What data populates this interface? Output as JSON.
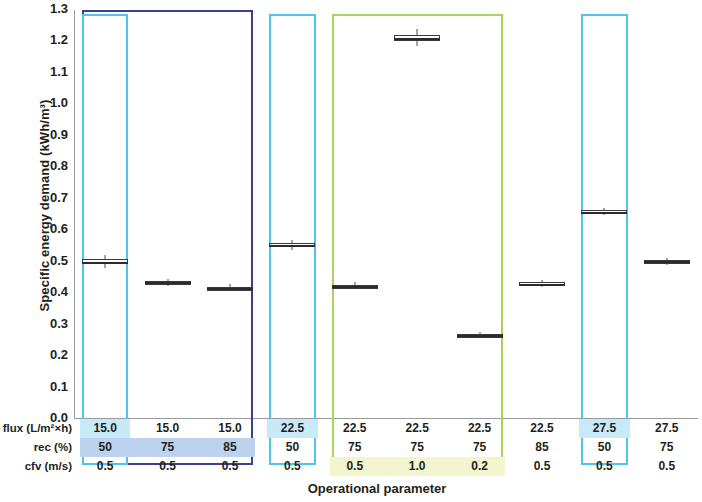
{
  "chart_data": {
    "type": "box",
    "title": "",
    "xlabel": "Operational parameter",
    "ylabel": "Specific energy demand (kWh/m³)",
    "ylim": [
      0.0,
      1.3
    ],
    "ytick_labels": [
      "1.3",
      "1.2",
      "1.1",
      "1.0",
      "0.9",
      "0.8",
      "0.7",
      "0.6",
      "0.5",
      "0.4",
      "0.3",
      "0.2",
      "0.1",
      "0.0"
    ],
    "ytick_values": [
      1.3,
      1.2,
      1.1,
      1.0,
      0.9,
      0.8,
      0.7,
      0.6,
      0.5,
      0.4,
      0.3,
      0.2,
      0.1,
      0.0
    ],
    "grid": false,
    "legend": "none",
    "parameter_rows": [
      {
        "label": "flux (L/m²×h)",
        "key": "flux"
      },
      {
        "label": "rec (%)",
        "key": "rec"
      },
      {
        "label": "cfv (m/s)",
        "key": "cfv"
      }
    ],
    "categories": [
      {
        "flux": "15.0",
        "rec": "50",
        "cfv": "0.5"
      },
      {
        "flux": "15.0",
        "rec": "75",
        "cfv": "0.5"
      },
      {
        "flux": "15.0",
        "rec": "85",
        "cfv": "0.5"
      },
      {
        "flux": "22.5",
        "rec": "50",
        "cfv": "0.5"
      },
      {
        "flux": "22.5",
        "rec": "75",
        "cfv": "0.5"
      },
      {
        "flux": "22.5",
        "rec": "75",
        "cfv": "1.0"
      },
      {
        "flux": "22.5",
        "rec": "75",
        "cfv": "0.2"
      },
      {
        "flux": "22.5",
        "rec": "85",
        "cfv": "0.5"
      },
      {
        "flux": "27.5",
        "rec": "50",
        "cfv": "0.5"
      },
      {
        "flux": "27.5",
        "rec": "75",
        "cfv": "0.5"
      }
    ],
    "boxes": [
      {
        "index": 0,
        "median": 0.5,
        "q1": 0.492,
        "q3": 0.51,
        "whisker_low": 0.48,
        "whisker_high": 0.522
      },
      {
        "index": 1,
        "median": 0.434,
        "q1": 0.43,
        "q3": 0.438,
        "whisker_low": 0.423,
        "whisker_high": 0.444
      },
      {
        "index": 2,
        "median": 0.417,
        "q1": 0.413,
        "q3": 0.421,
        "whisker_low": 0.406,
        "whisker_high": 0.428
      },
      {
        "index": 3,
        "median": 0.553,
        "q1": 0.547,
        "q3": 0.56,
        "whisker_low": 0.538,
        "whisker_high": 0.57
      },
      {
        "index": 4,
        "median": 0.423,
        "q1": 0.419,
        "q3": 0.427,
        "whisker_low": 0.412,
        "whisker_high": 0.434
      },
      {
        "index": 5,
        "median": 1.212,
        "q1": 1.203,
        "q3": 1.222,
        "whisker_low": 1.186,
        "whisker_high": 1.24
      },
      {
        "index": 6,
        "median": 0.266,
        "q1": 0.262,
        "q3": 0.27,
        "whisker_low": 0.256,
        "whisker_high": 0.277
      },
      {
        "index": 7,
        "median": 0.43,
        "q1": 0.426,
        "q3": 0.434,
        "whisker_low": 0.419,
        "whisker_high": 0.441
      },
      {
        "index": 8,
        "median": 0.659,
        "q1": 0.655,
        "q3": 0.663,
        "whisker_low": 0.648,
        "whisker_high": 0.67
      },
      {
        "index": 9,
        "median": 0.501,
        "q1": 0.497,
        "q3": 0.505,
        "whisker_low": 0.49,
        "whisker_high": 0.512
      }
    ],
    "group_rects": [
      {
        "name": "flux-15-group",
        "color": "#3b3f8f",
        "from_col": 0,
        "to_col": 2
      },
      {
        "name": "rec-50-col1-group",
        "color": "#4fc3ec",
        "from_col": 0,
        "to_col": 0
      },
      {
        "name": "flux-22p5-rec50-group",
        "color": "#4fc3ec",
        "from_col": 3,
        "to_col": 3
      },
      {
        "name": "cfv-variation-group",
        "color": "#a8d45c",
        "from_col": 4,
        "to_col": 6
      },
      {
        "name": "flux-27p5-rec50-group",
        "color": "#4fc3ec",
        "from_col": 8,
        "to_col": 8
      }
    ],
    "highlight_bands": [
      {
        "name": "flux-highlight-col1",
        "row": "flux",
        "from_col": 0,
        "to_col": 0,
        "color": "#c8e9f7"
      },
      {
        "name": "rec-highlight-navy-group",
        "row": "rec",
        "from_col": 0,
        "to_col": 2,
        "color": "#bcd2ee"
      },
      {
        "name": "flux-highlight-col4",
        "row": "flux",
        "from_col": 3,
        "to_col": 3,
        "color": "#c8e9f7"
      },
      {
        "name": "cfv-highlight-green-group",
        "row": "cfv",
        "from_col": 4,
        "to_col": 6,
        "color": "#f2f5cd"
      },
      {
        "name": "flux-highlight-col9",
        "row": "flux",
        "from_col": 8,
        "to_col": 8,
        "color": "#c8e9f7"
      }
    ],
    "colors": {
      "navy": "#3b3f8f",
      "cyan": "#4fc3ec",
      "green": "#a8d45c",
      "axis": "#9a9a9a",
      "text": "#231f20",
      "marker": "#3a3a3a"
    }
  }
}
